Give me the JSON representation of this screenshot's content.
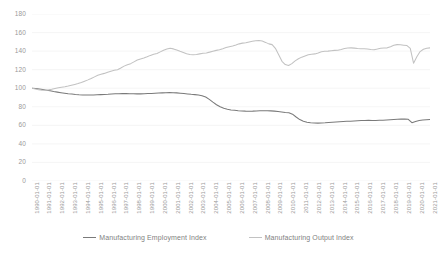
{
  "chart_data": {
    "type": "line",
    "title": "",
    "subtitle": "",
    "xlabel": "",
    "ylabel": "",
    "ylim": [
      0,
      180
    ],
    "y_ticks": [
      0,
      20,
      40,
      60,
      80,
      100,
      120,
      140,
      160,
      180
    ],
    "grid": true,
    "grid_axis": "y",
    "legend_position": "bottom",
    "x": [
      "1990-01-01",
      "1991-01-01",
      "1992-01-01",
      "1993-01-01",
      "1994-01-01",
      "1995-01-01",
      "1996-01-01",
      "1997-01-01",
      "1998-01-01",
      "1999-01-01",
      "2000-01-01",
      "2001-01-01",
      "2002-01-01",
      "2003-01-01",
      "2004-01-01",
      "2005-01-01",
      "2006-01-01",
      "2007-01-01",
      "2008-01-01",
      "2009-01-01",
      "2010-01-01",
      "2011-01-01",
      "2012-01-01",
      "2013-01-01",
      "2014-01-01",
      "2015-01-01",
      "2016-01-01",
      "2017-01-01",
      "2018-01-01",
      "2019-01-01",
      "2020-01-01",
      "2021-01-01"
    ],
    "series": [
      {
        "name": "Manufacturing Employment Index",
        "color": "#7a7a7a",
        "values": [
          100.0,
          96.2,
          93.6,
          92.6,
          93.2,
          94.2,
          93.9,
          94.4,
          95.2,
          93.8,
          93.0,
          88.0,
          80.0,
          76.5,
          75.2,
          75.6,
          75.8,
          74.9,
          73.5,
          64.5,
          62.4,
          63.0,
          63.9,
          64.3,
          64.9,
          65.5,
          65.3,
          65.5,
          66.4,
          66.8,
          62.8,
          66.2
        ],
        "monthly_detail": [
          100.0,
          99.6,
          99.2,
          98.6,
          97.9,
          97.2,
          96.4,
          95.8,
          95.2,
          94.6,
          94.1,
          93.7,
          93.3,
          93.0,
          92.8,
          92.7,
          92.6,
          92.7,
          92.9,
          93.1,
          93.3,
          93.5,
          93.8,
          94.0,
          94.1,
          94.2,
          94.2,
          94.1,
          94.0,
          93.9,
          93.9,
          94.0,
          94.2,
          94.4,
          94.6,
          94.8,
          95.0,
          95.2,
          95.3,
          95.2,
          95.0,
          94.6,
          94.2,
          93.8,
          93.4,
          93.1,
          92.8,
          92.0,
          90.5,
          88.0,
          85.0,
          82.2,
          80.0,
          78.4,
          77.3,
          76.6,
          76.2,
          75.8,
          75.5,
          75.3,
          75.2,
          75.3,
          75.5,
          75.7,
          75.8,
          75.8,
          75.6,
          75.3,
          74.9,
          74.4,
          73.8,
          73.5,
          72.0,
          69.0,
          66.2,
          64.5,
          63.4,
          62.8,
          62.5,
          62.4,
          62.5,
          62.7,
          63.0,
          63.3,
          63.6,
          63.9,
          64.1,
          64.3,
          64.5,
          64.7,
          64.9,
          65.1,
          65.3,
          65.4,
          65.3,
          65.3,
          65.4,
          65.5,
          65.8,
          66.1,
          66.4,
          66.6,
          66.7,
          66.8,
          66.5,
          62.8,
          64.2,
          65.3,
          65.8,
          66.0,
          66.2
        ],
        "start_value": 100,
        "end_value": 66.2,
        "min_value": 62.4,
        "max_value": 100.0
      },
      {
        "name": "Manufacturing Output Index",
        "color": "#c2c2c2",
        "values": [
          100.0,
          97.8,
          101.5,
          105.0,
          110.5,
          116.0,
          120.0,
          126.5,
          132.5,
          137.5,
          143.0,
          138.5,
          136.0,
          138.0,
          141.5,
          145.5,
          149.0,
          151.5,
          147.0,
          124.5,
          133.5,
          137.0,
          140.0,
          141.0,
          143.5,
          142.5,
          141.5,
          143.5,
          147.0,
          146.0,
          127.0,
          143.5
        ],
        "monthly_detail": [
          100.0,
          99.2,
          98.4,
          97.9,
          97.8,
          98.2,
          98.9,
          99.7,
          100.4,
          101.0,
          101.5,
          102.3,
          103.2,
          104.1,
          105.0,
          106.2,
          107.6,
          109.0,
          110.5,
          112.2,
          113.9,
          115.0,
          116.0,
          117.2,
          118.4,
          119.3,
          120.0,
          121.8,
          123.8,
          125.4,
          126.5,
          128.4,
          130.4,
          131.6,
          132.5,
          133.9,
          135.4,
          136.6,
          137.5,
          139.2,
          141.0,
          142.2,
          143.0,
          142.4,
          141.2,
          139.8,
          138.5,
          137.2,
          136.4,
          136.0,
          136.4,
          137.0,
          137.6,
          138.0,
          138.9,
          139.9,
          140.8,
          141.5,
          142.6,
          143.8,
          144.8,
          145.5,
          146.6,
          147.8,
          148.6,
          149.0,
          149.8,
          150.6,
          151.2,
          151.5,
          150.8,
          149.4,
          147.8,
          147.0,
          143.0,
          136.0,
          129.0,
          125.5,
          124.5,
          126.5,
          129.5,
          131.8,
          133.5,
          134.8,
          136.0,
          136.6,
          137.0,
          138.0,
          139.2,
          139.8,
          140.0,
          140.4,
          140.8,
          141.0,
          141.8,
          142.8,
          143.3,
          143.5,
          143.2,
          142.8,
          142.6,
          142.5,
          142.2,
          141.8,
          141.5,
          142.2,
          143.0,
          143.4,
          143.5,
          144.8,
          146.2,
          147.0,
          146.8,
          146.4,
          146.0,
          143.0,
          127.0,
          134.0,
          139.5,
          142.0,
          143.0,
          143.5
        ],
        "start_value": 100,
        "end_value": 143.5,
        "min_value": 97.8,
        "max_value": 151.5
      }
    ]
  },
  "legend": {
    "items": [
      {
        "label": "Manufacturing Employment Index",
        "color": "#7a7a7a"
      },
      {
        "label": "Manufacturing Output Index",
        "color": "#c2c2c2"
      }
    ]
  },
  "axes": {
    "y_tick_labels": [
      "180",
      "160",
      "140",
      "120",
      "100",
      "80",
      "60",
      "40",
      "20",
      "0"
    ],
    "x_tick_labels": [
      "1990-01-01",
      "1991-01-01",
      "1992-01-01",
      "1993-01-01",
      "1994-01-01",
      "1995-01-01",
      "1996-01-01",
      "1997-01-01",
      "1998-01-01",
      "1999-01-01",
      "2000-01-01",
      "2001-01-01",
      "2002-01-01",
      "2003-01-01",
      "2004-01-01",
      "2005-01-01",
      "2006-01-01",
      "2007-01-01",
      "2008-01-01",
      "2009-01-01",
      "2010-01-01",
      "2011-01-01",
      "2012-01-01",
      "2013-01-01",
      "2014-01-01",
      "2015-01-01",
      "2016-01-01",
      "2017-01-01",
      "2018-01-01",
      "2019-01-01",
      "2020-01-01",
      "2021-01-01"
    ]
  },
  "style": {
    "background": "#ffffff",
    "gridline_color": "#f0f0f0",
    "axis_text_color": "#9a9a9a",
    "legend_text_color": "#7f7f7f"
  }
}
